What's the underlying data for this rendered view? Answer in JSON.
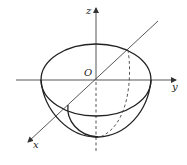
{
  "diagram": {
    "type": "hemisphere-in-3d-axes",
    "labels": {
      "origin": "O",
      "x_axis": "x",
      "y_axis": "y",
      "z_axis": "z"
    },
    "colors": {
      "stroke": "#222222",
      "axis": "#444444",
      "background": "#ffffff"
    }
  }
}
